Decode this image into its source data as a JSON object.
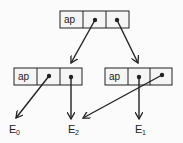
{
  "diagram": {
    "type": "linked-structure",
    "nodes": [
      {
        "id": "top",
        "cells": [
          "ap",
          "•",
          "•"
        ]
      },
      {
        "id": "left",
        "cells": [
          "ap",
          "•",
          "•"
        ]
      },
      {
        "id": "right",
        "cells": [
          "ap",
          "•",
          "•"
        ]
      }
    ],
    "labels": [
      {
        "id": "E0",
        "base": "E",
        "sub": "0"
      },
      {
        "id": "E2",
        "base": "E",
        "sub": "2"
      },
      {
        "id": "E1",
        "base": "E",
        "sub": "1"
      }
    ],
    "edges": [
      {
        "from": "top.cell2",
        "to": "left.cell3"
      },
      {
        "from": "top.cell3",
        "to": "right.cell2"
      },
      {
        "from": "left.cell2",
        "to": "E0"
      },
      {
        "from": "left.cell3",
        "to": "E2"
      },
      {
        "from": "right.cell2",
        "to": "E1"
      },
      {
        "from": "right.cell3",
        "to": "E2"
      }
    ],
    "colors": {
      "line": "#222222",
      "cell_fill": "#f5f5f5"
    }
  }
}
